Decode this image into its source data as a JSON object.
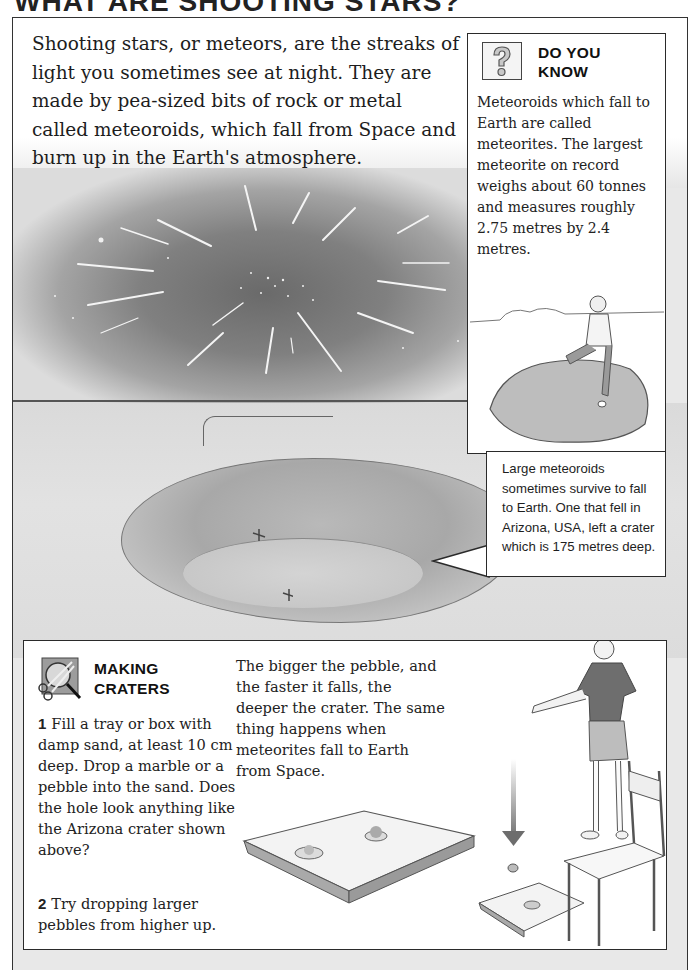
{
  "page": {
    "title": "WHAT ARE SHOOTING STARS?"
  },
  "intro": {
    "text": "Shooting stars, or meteors, are the streaks of light you sometimes see at night. They are made by pea-sized bits of rock or metal called meteoroids, which fall from Space and burn up in the Earth's atmosphere."
  },
  "illustration": {
    "scene": "meteor-shower-over-crater",
    "colors": {
      "sky_dark": "#6a6a6a",
      "sky_light": "#dcdcdc",
      "ground": "#dadada"
    }
  },
  "did_you_know": {
    "icon": "question-mark-icon",
    "title_line1": "DO YOU",
    "title_line2": "KNOW",
    "text": "Meteoroids which fall to Earth are called meteorites. The largest meteorite on record weighs about 60 tonnes and measures roughly 2.75 metres by 2.4 metres."
  },
  "callout": {
    "text": "Large meteoroids sometimes survive to fall to Earth. One that fell in Arizona, USA, left a crater which is 175 metres deep."
  },
  "making_craters": {
    "icon": "scissors-magnifier-icon",
    "title_line1": "MAKING",
    "title_line2": "CRATERS",
    "steps": [
      {
        "num": "1",
        "text": "Fill a tray or box with damp sand, at least 10 cm deep. Drop a marble or a pebble into the sand. Does the hole look anything like the Arizona crater shown above?"
      },
      {
        "num": "2",
        "text": "Try dropping larger pebbles from higher up."
      }
    ],
    "explanation": "The bigger the pebble, and the faster it falls, the deeper the crater. The same thing happens when meteorites fall to Earth from Space."
  }
}
